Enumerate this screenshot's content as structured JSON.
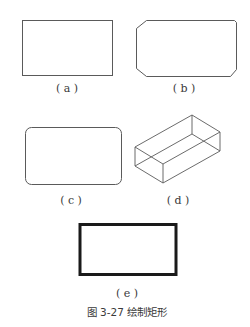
{
  "figure": {
    "caption": "图 3-27   绘制矩形",
    "panels": [
      {
        "id": "a",
        "label": "( a )",
        "shape": "plain-rectangle"
      },
      {
        "id": "b",
        "label": "( b )",
        "shape": "chamfered-rectangle"
      },
      {
        "id": "c",
        "label": "( c )",
        "shape": "filleted-rectangle"
      },
      {
        "id": "d",
        "label": "( d )",
        "shape": "3d-box-rectangle"
      },
      {
        "id": "e",
        "label": "( e )",
        "shape": "thick-width-rectangle"
      }
    ],
    "colors": {
      "stroke": "#5a5a5a",
      "thick_stroke": "#1a1a1a",
      "text": "#3a3a3a"
    }
  }
}
